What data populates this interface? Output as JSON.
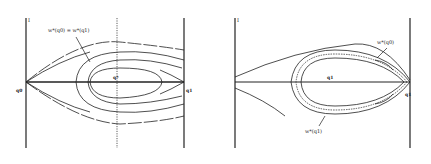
{
  "figures": [
    {
      "id": "left",
      "axis_label": "I",
      "left_point": "q0",
      "right_point": "q1",
      "center_point": "q*",
      "annotation": "w*(q0) = w*(q1)",
      "has_dotted_vertical": true
    },
    {
      "id": "right",
      "axis_label": "I",
      "right_point": "q1",
      "center_point": "q1",
      "annotation_top": "w*(q0)",
      "annotation_bottom": "w*(q1)"
    }
  ],
  "colors": {
    "line": "#222222",
    "background": "#ffffff"
  }
}
